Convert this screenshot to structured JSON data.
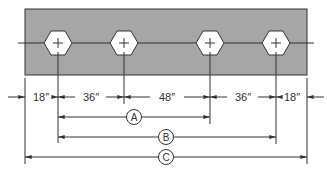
{
  "diagram": {
    "colors": {
      "plate_fill": "#a6a6a6",
      "line": "#333333",
      "hole_fill": "#ffffff"
    },
    "plate": {
      "x": 25,
      "y": 9,
      "width": 282,
      "height": 66
    },
    "holes": [
      {
        "label": "hole-1",
        "cx": 58
      },
      {
        "label": "hole-2",
        "cx": 124
      },
      {
        "label": "hole-3",
        "cx": 210
      },
      {
        "label": "hole-4",
        "cx": 276
      }
    ],
    "dimensions": {
      "segments": [
        {
          "label": "18″",
          "from": 25,
          "to": 58
        },
        {
          "label": "36″",
          "from": 58,
          "to": 124
        },
        {
          "label": "48″",
          "from": 124,
          "to": 210
        },
        {
          "label": "36″",
          "from": 210,
          "to": 276
        },
        {
          "label": "18″",
          "from": 276,
          "to": 307
        }
      ],
      "callouts": [
        {
          "label": "A",
          "from": 58,
          "to": 210
        },
        {
          "label": "B",
          "from": 58,
          "to": 276
        },
        {
          "label": "C",
          "from": 25,
          "to": 307
        }
      ]
    }
  }
}
